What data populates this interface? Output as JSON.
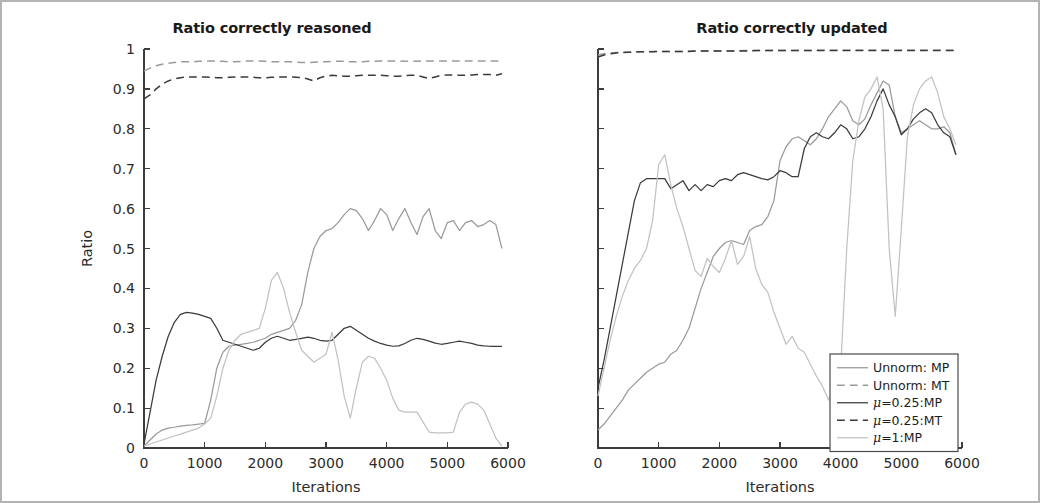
{
  "figure": {
    "border_color": "#b4b4b4",
    "background": "#ffffff"
  },
  "axis": {
    "xlabel": "Iterations",
    "ylabel": "Ratio",
    "xticks": [
      "0",
      "1000",
      "2000",
      "3000",
      "4000",
      "5000",
      "6000"
    ],
    "yticks": [
      "0",
      "0.1",
      "0.2",
      "0.3",
      "0.4",
      "0.5",
      "0.6",
      "0.7",
      "0.8",
      "0.9",
      "1"
    ]
  },
  "legend": {
    "position": "bottom-right-of-right-panel",
    "items": [
      {
        "label": "Unnorm: MP",
        "style": "solid",
        "color": "#9a9a9a"
      },
      {
        "label": "Unnorm: MT",
        "style": "dashed",
        "color": "#9a9a9a"
      },
      {
        "label": "μ=0.25:MP",
        "style": "solid",
        "color": "#3b3b3b"
      },
      {
        "label": "μ=0.25:MT",
        "style": "dashed",
        "color": "#3b3b3b"
      },
      {
        "label": "μ=1:MP",
        "style": "solid",
        "color": "#c2c2c2"
      }
    ]
  },
  "chart_data": [
    {
      "id": "left",
      "type": "line",
      "title": "Ratio correctly reasoned",
      "xlabel": "Iterations",
      "ylabel": "Ratio",
      "xlim": [
        0,
        6000
      ],
      "ylim": [
        0,
        1
      ],
      "grid": false,
      "legend": "none",
      "x": [
        0,
        100,
        200,
        300,
        400,
        500,
        600,
        700,
        800,
        900,
        1000,
        1100,
        1200,
        1300,
        1400,
        1500,
        1600,
        1700,
        1800,
        1900,
        2000,
        2100,
        2200,
        2300,
        2400,
        2500,
        2600,
        2700,
        2800,
        2900,
        3000,
        3100,
        3200,
        3300,
        3400,
        3500,
        3600,
        3700,
        3800,
        3900,
        4000,
        4100,
        4200,
        4300,
        4400,
        4500,
        4600,
        4700,
        4800,
        4900,
        5000,
        5100,
        5200,
        5300,
        5400,
        5500,
        5600,
        5700,
        5800,
        5900
      ],
      "series": [
        {
          "name": "Unnorm: MP",
          "color": "#9a9a9a",
          "style": "solid",
          "values": [
            0.005,
            0.02,
            0.035,
            0.045,
            0.05,
            0.052,
            0.055,
            0.057,
            0.058,
            0.06,
            0.062,
            0.12,
            0.2,
            0.24,
            0.255,
            0.258,
            0.26,
            0.262,
            0.265,
            0.27,
            0.275,
            0.285,
            0.29,
            0.295,
            0.3,
            0.32,
            0.36,
            0.44,
            0.5,
            0.53,
            0.545,
            0.55,
            0.565,
            0.585,
            0.6,
            0.595,
            0.575,
            0.545,
            0.57,
            0.6,
            0.585,
            0.545,
            0.575,
            0.6,
            0.565,
            0.535,
            0.58,
            0.6,
            0.545,
            0.525,
            0.565,
            0.57,
            0.545,
            0.565,
            0.57,
            0.555,
            0.56,
            0.57,
            0.56,
            0.5
          ]
        },
        {
          "name": "Unnorm: MT",
          "color": "#9a9a9a",
          "style": "dashed",
          "values": [
            0.945,
            0.952,
            0.958,
            0.962,
            0.964,
            0.966,
            0.968,
            0.968,
            0.968,
            0.969,
            0.97,
            0.97,
            0.97,
            0.969,
            0.968,
            0.968,
            0.969,
            0.97,
            0.97,
            0.97,
            0.969,
            0.968,
            0.968,
            0.968,
            0.968,
            0.967,
            0.966,
            0.966,
            0.967,
            0.968,
            0.968,
            0.969,
            0.969,
            0.969,
            0.968,
            0.968,
            0.968,
            0.969,
            0.969,
            0.97,
            0.97,
            0.97,
            0.97,
            0.969,
            0.969,
            0.969,
            0.97,
            0.97,
            0.97,
            0.97,
            0.97,
            0.97,
            0.97,
            0.97,
            0.97,
            0.97,
            0.97,
            0.97,
            0.97,
            0.97
          ]
        },
        {
          "name": "μ=0.25:MP",
          "color": "#3b3b3b",
          "style": "solid",
          "values": [
            0.01,
            0.09,
            0.17,
            0.23,
            0.28,
            0.315,
            0.335,
            0.34,
            0.338,
            0.335,
            0.33,
            0.325,
            0.3,
            0.27,
            0.265,
            0.26,
            0.255,
            0.25,
            0.245,
            0.25,
            0.265,
            0.275,
            0.28,
            0.275,
            0.27,
            0.272,
            0.275,
            0.278,
            0.275,
            0.27,
            0.268,
            0.27,
            0.285,
            0.3,
            0.305,
            0.295,
            0.285,
            0.275,
            0.268,
            0.262,
            0.258,
            0.255,
            0.256,
            0.262,
            0.27,
            0.275,
            0.272,
            0.268,
            0.263,
            0.26,
            0.262,
            0.265,
            0.268,
            0.265,
            0.262,
            0.258,
            0.256,
            0.255,
            0.255,
            0.255
          ]
        },
        {
          "name": "μ=0.25:MT",
          "color": "#3b3b3b",
          "style": "dashed",
          "values": [
            0.875,
            0.885,
            0.9,
            0.912,
            0.92,
            0.925,
            0.928,
            0.93,
            0.93,
            0.93,
            0.93,
            0.929,
            0.928,
            0.928,
            0.929,
            0.93,
            0.93,
            0.93,
            0.929,
            0.928,
            0.928,
            0.929,
            0.93,
            0.93,
            0.93,
            0.929,
            0.928,
            0.925,
            0.92,
            0.928,
            0.932,
            0.934,
            0.933,
            0.932,
            0.932,
            0.933,
            0.934,
            0.934,
            0.934,
            0.934,
            0.933,
            0.932,
            0.932,
            0.933,
            0.934,
            0.934,
            0.93,
            0.926,
            0.93,
            0.934,
            0.935,
            0.935,
            0.934,
            0.934,
            0.935,
            0.936,
            0.936,
            0.936,
            0.934,
            0.938
          ]
        },
        {
          "name": "μ=1:MP",
          "color": "#c2c2c2",
          "style": "solid",
          "values": [
            0.005,
            0.01,
            0.015,
            0.02,
            0.025,
            0.03,
            0.035,
            0.04,
            0.045,
            0.05,
            0.06,
            0.075,
            0.13,
            0.2,
            0.245,
            0.27,
            0.285,
            0.29,
            0.295,
            0.3,
            0.35,
            0.42,
            0.44,
            0.4,
            0.34,
            0.29,
            0.245,
            0.23,
            0.215,
            0.225,
            0.235,
            0.29,
            0.22,
            0.13,
            0.075,
            0.15,
            0.215,
            0.23,
            0.225,
            0.2,
            0.17,
            0.125,
            0.095,
            0.09,
            0.09,
            0.09,
            0.065,
            0.04,
            0.038,
            0.038,
            0.038,
            0.04,
            0.09,
            0.11,
            0.115,
            0.11,
            0.095,
            0.06,
            0.025,
            0.005
          ]
        }
      ]
    },
    {
      "id": "right",
      "type": "line",
      "title": "Ratio correctly updated",
      "xlabel": "Iterations",
      "ylabel": "",
      "xlim": [
        0,
        6000
      ],
      "ylim": [
        0,
        1
      ],
      "grid": false,
      "legend": "inside-bottom-right",
      "x": [
        0,
        100,
        200,
        300,
        400,
        500,
        600,
        700,
        800,
        900,
        1000,
        1100,
        1200,
        1300,
        1400,
        1500,
        1600,
        1700,
        1800,
        1900,
        2000,
        2100,
        2200,
        2300,
        2400,
        2500,
        2600,
        2700,
        2800,
        2900,
        3000,
        3100,
        3200,
        3300,
        3400,
        3500,
        3600,
        3700,
        3800,
        3900,
        4000,
        4100,
        4200,
        4300,
        4400,
        4500,
        4600,
        4700,
        4800,
        4900,
        5000,
        5100,
        5200,
        5300,
        5400,
        5500,
        5600,
        5700,
        5800,
        5900
      ],
      "series": [
        {
          "name": "Unnorm: MP",
          "color": "#9a9a9a",
          "style": "solid",
          "values": [
            0.045,
            0.06,
            0.08,
            0.1,
            0.12,
            0.145,
            0.16,
            0.175,
            0.19,
            0.2,
            0.21,
            0.215,
            0.235,
            0.245,
            0.27,
            0.3,
            0.35,
            0.4,
            0.44,
            0.48,
            0.5,
            0.515,
            0.52,
            0.515,
            0.51,
            0.545,
            0.555,
            0.56,
            0.58,
            0.62,
            0.72,
            0.755,
            0.775,
            0.78,
            0.77,
            0.76,
            0.775,
            0.8,
            0.83,
            0.85,
            0.87,
            0.855,
            0.82,
            0.81,
            0.825,
            0.86,
            0.89,
            0.92,
            0.91,
            0.83,
            0.79,
            0.8,
            0.81,
            0.82,
            0.81,
            0.8,
            0.8,
            0.805,
            0.79,
            0.735
          ]
        },
        {
          "name": "Unnorm: MT",
          "color": "#9a9a9a",
          "style": "dashed",
          "values": [
            0.985,
            0.988,
            0.99,
            0.991,
            0.992,
            0.992,
            0.993,
            0.993,
            0.993,
            0.994,
            0.994,
            0.994,
            0.994,
            0.994,
            0.994,
            0.995,
            0.995,
            0.995,
            0.995,
            0.995,
            0.995,
            0.995,
            0.995,
            0.995,
            0.996,
            0.996,
            0.996,
            0.996,
            0.996,
            0.996,
            0.996,
            0.996,
            0.996,
            0.996,
            0.996,
            0.996,
            0.997,
            0.997,
            0.997,
            0.997,
            0.997,
            0.997,
            0.997,
            0.997,
            0.997,
            0.997,
            0.997,
            0.997,
            0.997,
            0.997,
            0.997,
            0.997,
            0.997,
            0.997,
            0.997,
            0.997,
            0.997,
            0.997,
            0.997,
            0.997
          ]
        },
        {
          "name": "μ=0.25:MP",
          "color": "#3b3b3b",
          "style": "solid",
          "values": [
            0.15,
            0.22,
            0.3,
            0.38,
            0.46,
            0.54,
            0.62,
            0.665,
            0.675,
            0.675,
            0.675,
            0.675,
            0.65,
            0.66,
            0.67,
            0.645,
            0.66,
            0.645,
            0.66,
            0.655,
            0.67,
            0.675,
            0.67,
            0.685,
            0.69,
            0.685,
            0.68,
            0.675,
            0.672,
            0.68,
            0.695,
            0.69,
            0.68,
            0.68,
            0.75,
            0.78,
            0.79,
            0.78,
            0.775,
            0.79,
            0.81,
            0.8,
            0.775,
            0.78,
            0.8,
            0.83,
            0.87,
            0.9,
            0.86,
            0.83,
            0.785,
            0.8,
            0.825,
            0.84,
            0.85,
            0.84,
            0.81,
            0.79,
            0.78,
            0.735
          ]
        },
        {
          "name": "μ=0.25:MT",
          "color": "#3b3b3b",
          "style": "dashed",
          "values": [
            0.98,
            0.985,
            0.988,
            0.99,
            0.991,
            0.992,
            0.992,
            0.993,
            0.993,
            0.993,
            0.994,
            0.994,
            0.994,
            0.994,
            0.994,
            0.994,
            0.995,
            0.995,
            0.995,
            0.995,
            0.995,
            0.995,
            0.995,
            0.995,
            0.995,
            0.995,
            0.996,
            0.996,
            0.996,
            0.996,
            0.996,
            0.996,
            0.996,
            0.996,
            0.996,
            0.996,
            0.996,
            0.996,
            0.996,
            0.996,
            0.996,
            0.996,
            0.996,
            0.996,
            0.996,
            0.996,
            0.996,
            0.996,
            0.996,
            0.996,
            0.996,
            0.996,
            0.996,
            0.996,
            0.996,
            0.996,
            0.996,
            0.996,
            0.996,
            0.996
          ]
        },
        {
          "name": "μ=1:MP",
          "color": "#c2c2c2",
          "style": "solid",
          "values": [
            0.13,
            0.2,
            0.27,
            0.33,
            0.38,
            0.42,
            0.45,
            0.47,
            0.5,
            0.57,
            0.71,
            0.735,
            0.66,
            0.6,
            0.555,
            0.5,
            0.445,
            0.43,
            0.475,
            0.455,
            0.44,
            0.475,
            0.52,
            0.46,
            0.48,
            0.53,
            0.45,
            0.41,
            0.39,
            0.34,
            0.3,
            0.26,
            0.28,
            0.25,
            0.24,
            0.21,
            0.18,
            0.155,
            0.12,
            0.16,
            0.2,
            0.5,
            0.72,
            0.82,
            0.88,
            0.9,
            0.93,
            0.85,
            0.5,
            0.33,
            0.55,
            0.78,
            0.86,
            0.9,
            0.92,
            0.93,
            0.89,
            0.83,
            0.8,
            0.76
          ]
        }
      ]
    }
  ]
}
